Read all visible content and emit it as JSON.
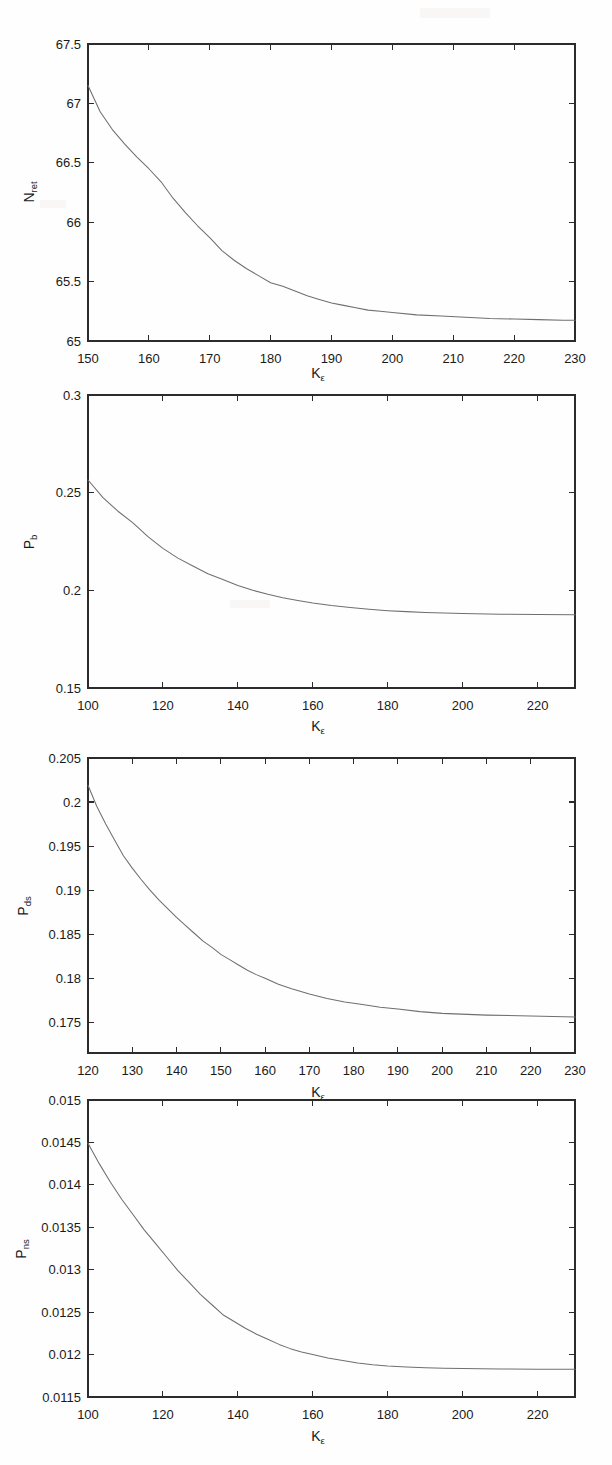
{
  "figure": {
    "background": "#fefefe",
    "curve_color": "#6f6f6f",
    "axis_color": "#2b2b2b",
    "panel_count": 4
  },
  "panels": [
    {
      "name": "panel-n-ret",
      "ylabel_main": "N",
      "ylabel_sub": "ret",
      "xlabel_main": "K",
      "xlabel_sub": "ε"
    },
    {
      "name": "panel-p-b",
      "ylabel_main": "P",
      "ylabel_sub": "b",
      "xlabel_main": "K",
      "xlabel_sub": "ε"
    },
    {
      "name": "panel-p-ds",
      "ylabel_main": "P",
      "ylabel_sub": "ds",
      "xlabel_main": "K",
      "xlabel_sub": "ε"
    },
    {
      "name": "panel-p-ns",
      "ylabel_main": "P",
      "ylabel_sub": "ns",
      "xlabel_main": "K",
      "xlabel_sub": "ε"
    }
  ],
  "chart_data": [
    {
      "type": "line",
      "title": "",
      "xlabel": "K_ε",
      "ylabel": "N_ret",
      "xlim": [
        150,
        230
      ],
      "ylim": [
        65,
        67.5
      ],
      "xticks": [
        150,
        160,
        170,
        180,
        190,
        200,
        210,
        220,
        230
      ],
      "yticks": [
        65,
        65.5,
        66,
        66.5,
        67,
        67.5
      ],
      "xticklabels": [
        "150",
        "160",
        "170",
        "180",
        "190",
        "200",
        "210",
        "220",
        "230"
      ],
      "yticklabels": [
        "65",
        "65.5",
        "66",
        "66.5",
        "67",
        "67.5"
      ],
      "grid": false,
      "legend": null,
      "series": [
        {
          "name": "N_ret",
          "x": [
            150,
            152,
            154,
            156,
            158,
            160,
            162,
            164,
            166,
            168,
            170,
            172,
            174,
            176,
            178,
            180,
            182,
            184,
            186,
            188,
            190,
            192,
            194,
            196,
            198,
            200,
            204,
            208,
            212,
            216,
            220,
            224,
            228,
            230
          ],
          "y": [
            67.15,
            66.93,
            66.78,
            66.66,
            66.55,
            66.45,
            66.34,
            66.2,
            66.08,
            65.97,
            65.87,
            65.76,
            65.68,
            65.61,
            65.55,
            65.49,
            65.46,
            65.42,
            65.38,
            65.35,
            65.32,
            65.3,
            65.28,
            65.26,
            65.25,
            65.24,
            65.22,
            65.21,
            65.2,
            65.19,
            65.185,
            65.18,
            65.175,
            65.175
          ]
        }
      ]
    },
    {
      "type": "line",
      "title": "",
      "xlabel": "K_ε",
      "ylabel": "P_b",
      "xlim": [
        100,
        230
      ],
      "ylim": [
        0.15,
        0.3
      ],
      "xticks": [
        100,
        120,
        140,
        160,
        180,
        200,
        220
      ],
      "yticks": [
        0.15,
        0.2,
        0.25,
        0.3
      ],
      "xticklabels": [
        "100",
        "120",
        "140",
        "160",
        "180",
        "200",
        "220"
      ],
      "yticklabels": [
        "0.15",
        "0.2",
        "0.25",
        "0.3"
      ],
      "grid": false,
      "legend": null,
      "series": [
        {
          "name": "P_b",
          "x": [
            100,
            104,
            108,
            112,
            116,
            120,
            124,
            128,
            132,
            136,
            140,
            144,
            148,
            152,
            156,
            160,
            165,
            170,
            175,
            180,
            185,
            190,
            195,
            200,
            210,
            220,
            230
          ],
          "y": [
            0.2565,
            0.2475,
            0.2405,
            0.2345,
            0.2275,
            0.2215,
            0.2165,
            0.2125,
            0.2085,
            0.2055,
            0.2025,
            0.2,
            0.198,
            0.1962,
            0.1948,
            0.1935,
            0.1922,
            0.1912,
            0.1903,
            0.1896,
            0.1891,
            0.1887,
            0.1884,
            0.1881,
            0.1878,
            0.1876,
            0.1875
          ]
        }
      ]
    },
    {
      "type": "line",
      "title": "",
      "xlabel": "K_ε",
      "ylabel": "P_ds",
      "xlim": [
        120,
        230
      ],
      "ylim": [
        0.1715,
        0.205
      ],
      "xticks": [
        120,
        130,
        140,
        150,
        160,
        170,
        180,
        190,
        200,
        210,
        220,
        230
      ],
      "yticks": [
        0.175,
        0.18,
        0.185,
        0.19,
        0.195,
        0.2,
        0.205
      ],
      "xticklabels": [
        "120",
        "130",
        "140",
        "150",
        "160",
        "170",
        "180",
        "190",
        "200",
        "210",
        "220",
        "230"
      ],
      "yticklabels": [
        "0.175",
        "0.18",
        "0.185",
        "0.19",
        "0.195",
        "0.2",
        "0.205"
      ],
      "grid": false,
      "legend": null,
      "series": [
        {
          "name": "P_ds",
          "x": [
            120,
            122,
            124,
            126,
            128,
            130,
            132,
            134,
            136,
            138,
            140,
            142,
            144,
            146,
            148,
            150,
            152,
            154,
            156,
            158,
            160,
            163,
            166,
            170,
            174,
            178,
            182,
            186,
            190,
            195,
            200,
            210,
            220,
            230
          ],
          "y": [
            0.2019,
            0.1995,
            0.1975,
            0.1957,
            0.1939,
            0.1925,
            0.1912,
            0.19,
            0.1889,
            0.1879,
            0.1869,
            0.186,
            0.1851,
            0.1842,
            0.1835,
            0.1827,
            0.1821,
            0.1815,
            0.1809,
            0.1804,
            0.18,
            0.1793,
            0.1788,
            0.1782,
            0.1777,
            0.1773,
            0.177,
            0.1767,
            0.1765,
            0.1762,
            0.176,
            0.1758,
            0.1757,
            0.1756
          ]
        }
      ]
    },
    {
      "type": "line",
      "title": "",
      "xlabel": "K_ε",
      "ylabel": "P_ns",
      "xlim": [
        100,
        230
      ],
      "ylim": [
        0.0115,
        0.015
      ],
      "xticks": [
        100,
        120,
        140,
        160,
        180,
        200,
        220
      ],
      "yticks": [
        0.0115,
        0.012,
        0.0125,
        0.013,
        0.0135,
        0.014,
        0.0145,
        0.015
      ],
      "xticklabels": [
        "100",
        "120",
        "140",
        "160",
        "180",
        "200",
        "220"
      ],
      "yticklabels": [
        "0.0115",
        "0.012",
        "0.0125",
        "0.013",
        "0.0135",
        "0.014",
        "0.0145",
        "0.015"
      ],
      "grid": false,
      "legend": null,
      "series": [
        {
          "name": "P_ns",
          "x": [
            100,
            103,
            106,
            109,
            112,
            115,
            118,
            121,
            124,
            127,
            130,
            133,
            136,
            139,
            142,
            145,
            148,
            151,
            154,
            157,
            160,
            164,
            168,
            172,
            176,
            180,
            185,
            190,
            195,
            200,
            210,
            220,
            230
          ],
          "y": [
            0.01449,
            0.01425,
            0.01403,
            0.01383,
            0.01365,
            0.01347,
            0.01331,
            0.01315,
            0.01299,
            0.01285,
            0.01271,
            0.01259,
            0.01247,
            0.01239,
            0.01231,
            0.01224,
            0.01218,
            0.01212,
            0.01207,
            0.01203,
            0.012,
            0.01196,
            0.01193,
            0.0119,
            0.01188,
            0.011865,
            0.011853,
            0.011845,
            0.01184,
            0.011836,
            0.011831,
            0.011828,
            0.011826
          ]
        }
      ]
    }
  ]
}
